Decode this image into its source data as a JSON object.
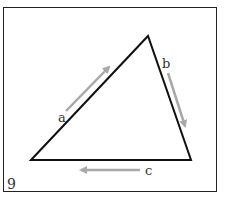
{
  "figure": {
    "number_label": "9",
    "triangle": {
      "vertices": {
        "left": [
          31,
          160
        ],
        "top": [
          148,
          36
        ],
        "right": [
          191,
          160
        ]
      },
      "stroke_color": "#111111"
    },
    "sides": [
      {
        "label": "a",
        "arrow_direction": "up-right",
        "label_pos": [
          58,
          122
        ]
      },
      {
        "label": "b",
        "arrow_direction": "down-right",
        "label_pos": [
          163,
          68
        ]
      },
      {
        "label": "c",
        "arrow_direction": "left",
        "label_pos": [
          145,
          175
        ]
      }
    ],
    "arrow_color": "#a8a8a8"
  }
}
